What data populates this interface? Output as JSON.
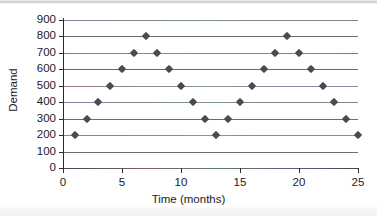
{
  "chart_data": {
    "type": "scatter",
    "title": "",
    "xlabel": "Time (months)",
    "ylabel": "Demand",
    "xlim": [
      0,
      25
    ],
    "ylim": [
      0,
      900
    ],
    "grid": true,
    "legend": "none",
    "marker": "diamond",
    "marker_color": "#4a4a52",
    "x_ticks": [
      0,
      5,
      10,
      15,
      20,
      25
    ],
    "x_tick_labels": [
      "0",
      "5",
      "10",
      "15",
      "20",
      "25"
    ],
    "y_ticks": [
      0,
      100,
      200,
      300,
      400,
      500,
      600,
      700,
      800,
      900
    ],
    "y_tick_labels": [
      "0",
      "100",
      "200",
      "300",
      "400",
      "500",
      "600",
      "700",
      "800",
      "900"
    ],
    "x": [
      1,
      2,
      3,
      4,
      5,
      6,
      7,
      8,
      9,
      10,
      11,
      12,
      13,
      14,
      15,
      16,
      17,
      18,
      19,
      20,
      21,
      22,
      23,
      24,
      25
    ],
    "values": [
      200,
      300,
      400,
      500,
      600,
      700,
      800,
      700,
      600,
      500,
      400,
      300,
      200,
      300,
      400,
      500,
      600,
      700,
      800,
      700,
      600,
      500,
      400,
      300,
      200
    ],
    "points": [
      {
        "x": 1,
        "y": 200
      },
      {
        "x": 2,
        "y": 300
      },
      {
        "x": 3,
        "y": 400
      },
      {
        "x": 4,
        "y": 500
      },
      {
        "x": 5,
        "y": 600
      },
      {
        "x": 6,
        "y": 700
      },
      {
        "x": 7,
        "y": 800
      },
      {
        "x": 8,
        "y": 700
      },
      {
        "x": 9,
        "y": 600
      },
      {
        "x": 10,
        "y": 500
      },
      {
        "x": 11,
        "y": 400
      },
      {
        "x": 12,
        "y": 300
      },
      {
        "x": 13,
        "y": 200
      },
      {
        "x": 14,
        "y": 300
      },
      {
        "x": 15,
        "y": 400
      },
      {
        "x": 16,
        "y": 500
      },
      {
        "x": 17,
        "y": 600
      },
      {
        "x": 18,
        "y": 700
      },
      {
        "x": 19,
        "y": 800
      },
      {
        "x": 20,
        "y": 700
      },
      {
        "x": 21,
        "y": 600
      },
      {
        "x": 22,
        "y": 500
      },
      {
        "x": 23,
        "y": 400
      },
      {
        "x": 24,
        "y": 300
      },
      {
        "x": 25,
        "y": 200
      }
    ]
  }
}
